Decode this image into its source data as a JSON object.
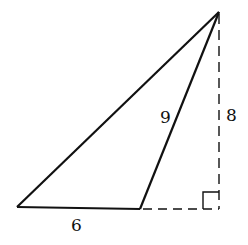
{
  "diagram": {
    "type": "triangle-with-altitude",
    "labels": {
      "hypotenuse_side": "9",
      "height": "8",
      "base": "6"
    },
    "colors": {
      "stroke": "#111111",
      "background": "#ffffff"
    }
  }
}
